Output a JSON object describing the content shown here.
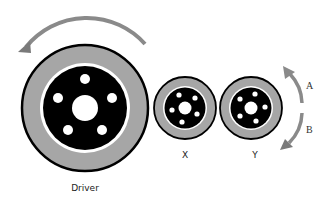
{
  "diagram": {
    "colors": {
      "outline": "#000000",
      "ring": "#a6a6a6",
      "inner_disk": "#000000",
      "hub": "#ffffff",
      "arrow": "#8a8a8a",
      "background": "#ffffff"
    },
    "wheels": [
      {
        "id": "driver",
        "label": "Driver",
        "cx": 85,
        "cy": 108,
        "r": 64
      },
      {
        "id": "x",
        "label": "X",
        "cx": 185,
        "cy": 108,
        "r": 31
      },
      {
        "id": "y",
        "label": "Y",
        "cx": 251,
        "cy": 108,
        "r": 31
      }
    ],
    "arrows": [
      {
        "id": "driver-rotation",
        "direction": "counterclockwise"
      },
      {
        "id": "option-a",
        "label": "A",
        "direction": "counterclockwise (up)"
      },
      {
        "id": "option-b",
        "label": "B",
        "direction": "clockwise (down)"
      }
    ],
    "labels": {
      "driver": "Driver",
      "x": "X",
      "y": "Y",
      "a": "A",
      "b": "B"
    }
  }
}
